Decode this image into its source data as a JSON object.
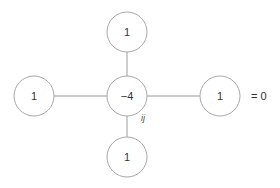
{
  "diagram": {
    "title": "",
    "stencil": {
      "center": {
        "label": "−4",
        "x": 127,
        "y": 96
      },
      "top": {
        "label": "1",
        "x": 127,
        "y": 32
      },
      "left": {
        "label": "1",
        "x": 34,
        "y": 96
      },
      "right": {
        "label": "1",
        "x": 220,
        "y": 96
      },
      "bottom": {
        "label": "1",
        "x": 127,
        "y": 157
      }
    },
    "index_label": "ij",
    "equation_suffix": "= 0",
    "colors": {
      "stroke": "#a8a8a8",
      "text": "#333333"
    }
  }
}
